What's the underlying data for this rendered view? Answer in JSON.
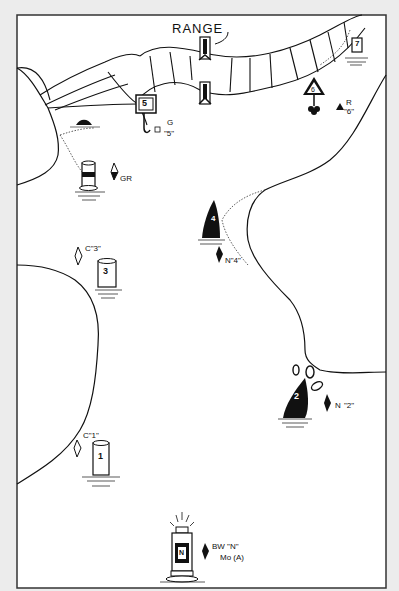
{
  "map": {
    "title": "RANGE",
    "background_color": "#ececec",
    "frame_color": "#333333",
    "water_color": "#ffffff",
    "ink_color": "#111111"
  },
  "aids": [
    {
      "id": "range-front",
      "type": "range-daymark",
      "label": ""
    },
    {
      "id": "range-rear",
      "type": "range-daymark",
      "label": ""
    },
    {
      "id": "daybeacon-5",
      "type": "square-daybeacon",
      "number": "5",
      "chart_label_color": "G",
      "chart_label_name": "\"5\""
    },
    {
      "id": "daybeacon-6",
      "type": "triangle-daybeacon",
      "number": "6",
      "chart_label_color": "R",
      "chart_label_name": "\"6\""
    },
    {
      "id": "daybeacon-7",
      "type": "square-daybeacon",
      "number": "7"
    },
    {
      "id": "junction-buoy",
      "type": "can-buoy-banded",
      "chart_label": "GR"
    },
    {
      "id": "can-3",
      "type": "can-buoy",
      "number": "3",
      "chart_label": "C\"3\""
    },
    {
      "id": "nun-4",
      "type": "nun-buoy",
      "number": "4",
      "chart_label": "N\"4\""
    },
    {
      "id": "nun-2",
      "type": "nun-buoy",
      "number": "2",
      "chart_label_a": "N",
      "chart_label_b": "\"2\""
    },
    {
      "id": "can-1",
      "type": "can-buoy",
      "number": "1",
      "chart_label": "C\"1\""
    },
    {
      "id": "safe-water-n",
      "type": "lighted-buoy",
      "number": "N",
      "chart_label_a": "BW \"N\"",
      "chart_label_b": "Mo (A)"
    }
  ]
}
